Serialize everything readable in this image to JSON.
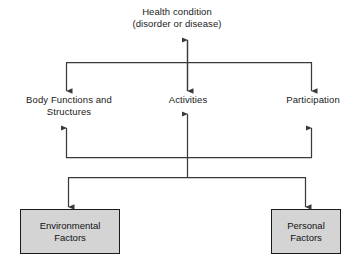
{
  "diagram": {
    "type": "flowchart",
    "nodes": {
      "health_condition": "Health condition\n(disorder or disease)",
      "body_functions": "Body Functions and\nStructures",
      "activities": "Activities",
      "participation": "Participation",
      "environmental_factors": "Environmental\nFactors",
      "personal_factors": "Personal\nFactors"
    },
    "caption": "",
    "colors": {
      "line": "#3a3a3a",
      "box_fill": "#d4d4d4",
      "box_border": "#1a1a1a",
      "text": "#1a1a1a",
      "background": "#ffffff"
    },
    "edges": [
      {
        "from": "health_condition",
        "to": "body_functions",
        "style": "arrow-down"
      },
      {
        "from": "health_condition",
        "to": "activities",
        "style": "double-arrow"
      },
      {
        "from": "health_condition",
        "to": "participation",
        "style": "arrow-down"
      },
      {
        "from": "environmental_factors",
        "to": "body_functions",
        "style": "arrow-up"
      },
      {
        "from": "environmental_factors",
        "to": "activities",
        "style": "arrow-up"
      },
      {
        "from": "environmental_factors",
        "to": "participation",
        "style": "arrow-up"
      },
      {
        "from": "activities",
        "to": "environmental_factors",
        "style": "arrow-down"
      },
      {
        "from": "activities",
        "to": "personal_factors",
        "style": "arrow-down"
      }
    ]
  }
}
